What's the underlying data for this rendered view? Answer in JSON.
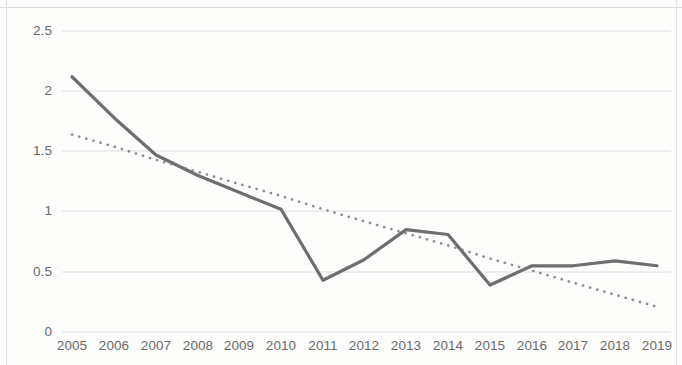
{
  "chart_data": {
    "type": "line",
    "title": "",
    "subtitle": "",
    "xlabel": "",
    "ylabel": "",
    "categories": [
      "2005",
      "2006",
      "2007",
      "2008",
      "2009",
      "2010",
      "2011",
      "2012",
      "2013",
      "2014",
      "2015",
      "2016",
      "2017",
      "2018",
      "2019"
    ],
    "series": [
      {
        "name": "value",
        "style": "solid",
        "color": "#6e6e6e",
        "values": [
          2.12,
          1.78,
          1.47,
          1.3,
          1.16,
          1.02,
          0.43,
          0.6,
          0.85,
          0.81,
          0.39,
          0.55,
          0.55,
          0.59,
          0.55
        ]
      },
      {
        "name": "trendline",
        "style": "dotted",
        "color": "#7b7b7b",
        "values": [
          1.64,
          1.54,
          1.43,
          1.33,
          1.23,
          1.13,
          1.02,
          0.92,
          0.82,
          0.72,
          0.61,
          0.51,
          0.41,
          0.31,
          0.21
        ]
      }
    ],
    "ylim": [
      0,
      2.5
    ],
    "ytick_values": [
      0,
      0.5,
      1,
      1.5,
      2,
      2.5
    ],
    "ytick_labels": [
      "0",
      "0.5",
      "1",
      "1.5",
      "2",
      "2.5"
    ],
    "grid": "horizontal",
    "legend": "none",
    "colors": {
      "grid": "#dfdfdf",
      "data_line": "#6e6e6e",
      "trend_line": "#7b7b7b",
      "tick_text": "#6a6a6a",
      "background": "#fdfdfc"
    }
  },
  "axes": {
    "y_ticks": [
      {
        "label": "2.5",
        "y": 31
      },
      {
        "label": "2",
        "y": 91
      },
      {
        "label": "1.5",
        "y": 151
      },
      {
        "label": "1",
        "y": 211
      },
      {
        "label": "0.5",
        "y": 272
      },
      {
        "label": "0",
        "y": 332
      }
    ],
    "x_ticks": [
      {
        "label": "2005",
        "x": 72
      },
      {
        "label": "2006",
        "x": 114
      },
      {
        "label": "2007",
        "x": 156
      },
      {
        "label": "2008",
        "x": 198
      },
      {
        "label": "2009",
        "x": 239
      },
      {
        "label": "2010",
        "x": 281
      },
      {
        "label": "2011",
        "x": 323
      },
      {
        "label": "2012",
        "x": 364
      },
      {
        "label": "2013",
        "x": 406
      },
      {
        "label": "2014",
        "x": 448
      },
      {
        "label": "2015",
        "x": 490
      },
      {
        "label": "2016",
        "x": 532
      },
      {
        "label": "2017",
        "x": 573
      },
      {
        "label": "2018",
        "x": 615
      },
      {
        "label": "2019",
        "x": 657
      }
    ]
  }
}
